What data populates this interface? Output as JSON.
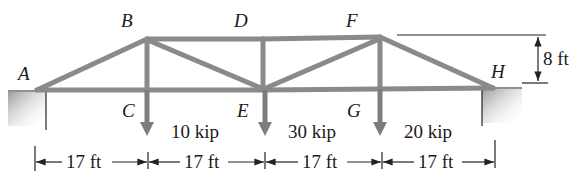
{
  "diagram": {
    "type": "truss",
    "joints": {
      "A": {
        "label": "A"
      },
      "B": {
        "label": "B"
      },
      "C": {
        "label": "C"
      },
      "D": {
        "label": "D"
      },
      "E": {
        "label": "E"
      },
      "F": {
        "label": "F"
      },
      "G": {
        "label": "G"
      },
      "H": {
        "label": "H"
      }
    },
    "loads": [
      {
        "joint": "C",
        "label": "10 kip"
      },
      {
        "joint": "E",
        "label": "30 kip"
      },
      {
        "joint": "G",
        "label": "20 kip"
      }
    ],
    "spans": [
      {
        "label": "17 ft"
      },
      {
        "label": "17 ft"
      },
      {
        "label": "17 ft"
      },
      {
        "label": "17 ft"
      }
    ],
    "height": {
      "label": "8 ft"
    },
    "colors": {
      "member": "#8a8a8a",
      "load_arrow": "#7d7d7d",
      "text": "#1a1a1a"
    }
  }
}
